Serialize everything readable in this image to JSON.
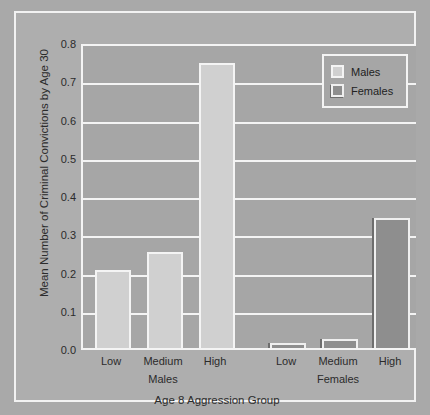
{
  "chart_data": {
    "type": "bar",
    "title": "",
    "xlabel": "Age 8 Aggression Group",
    "ylabel": "Mean Number of Criminal Convictions by Age 30",
    "categories": [
      "Low",
      "Medium",
      "High",
      "Low",
      "Medium",
      "High"
    ],
    "group_labels": [
      "Males",
      "Females"
    ],
    "series": [
      {
        "name": "Males",
        "color": "#d0d0d0",
        "values": [
          0.205,
          0.25,
          0.745,
          null,
          null,
          null
        ]
      },
      {
        "name": "Females",
        "color": "#8e8e8e",
        "values": [
          null,
          null,
          null,
          0.012,
          0.023,
          0.34
        ]
      }
    ],
    "bars": [
      {
        "label": "Low",
        "group": "Males",
        "series": "Males",
        "value": 0.205
      },
      {
        "label": "Medium",
        "group": "Males",
        "series": "Males",
        "value": 0.25
      },
      {
        "label": "High",
        "group": "Males",
        "series": "Males",
        "value": 0.745
      },
      {
        "label": "Low",
        "group": "Females",
        "series": "Females",
        "value": 0.012
      },
      {
        "label": "Medium",
        "group": "Females",
        "series": "Females",
        "value": 0.023
      },
      {
        "label": "High",
        "group": "Females",
        "series": "Females",
        "value": 0.34
      }
    ],
    "ylim": [
      0.0,
      0.8
    ],
    "ytick_labels": [
      "0.0",
      "0.1",
      "0.2",
      "0.3",
      "0.4",
      "0.5",
      "0.6",
      "0.7",
      "0.8"
    ],
    "ytick_values": [
      0.0,
      0.1,
      0.2,
      0.3,
      0.4,
      0.5,
      0.6,
      0.7,
      0.8
    ],
    "grid": true,
    "grid_axis": "y",
    "legend": {
      "position": "top-right",
      "entries": [
        {
          "label": "Males",
          "color": "#d0d0d0"
        },
        {
          "label": "Females",
          "color": "#8e8e8e"
        }
      ]
    },
    "colors": {
      "figure_background": "#a9a9a9",
      "panel_background": "#a6a6a6",
      "grid_color": "#f4f4f4",
      "text_color": "#2b2b2b"
    }
  }
}
